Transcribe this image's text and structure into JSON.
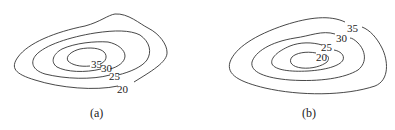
{
  "panels": [
    {
      "id": "a",
      "caption": "(a)",
      "contours": [
        {
          "value": "20",
          "label": "20"
        },
        {
          "value": "25",
          "label": "25"
        },
        {
          "value": "30",
          "label": "30"
        },
        {
          "value": "35",
          "label": "35"
        }
      ]
    },
    {
      "id": "b",
      "caption": "(b)",
      "contours": [
        {
          "value": "35",
          "label": "35"
        },
        {
          "value": "30",
          "label": "30"
        },
        {
          "value": "25",
          "label": "25"
        },
        {
          "value": "20",
          "label": "20"
        }
      ]
    }
  ]
}
